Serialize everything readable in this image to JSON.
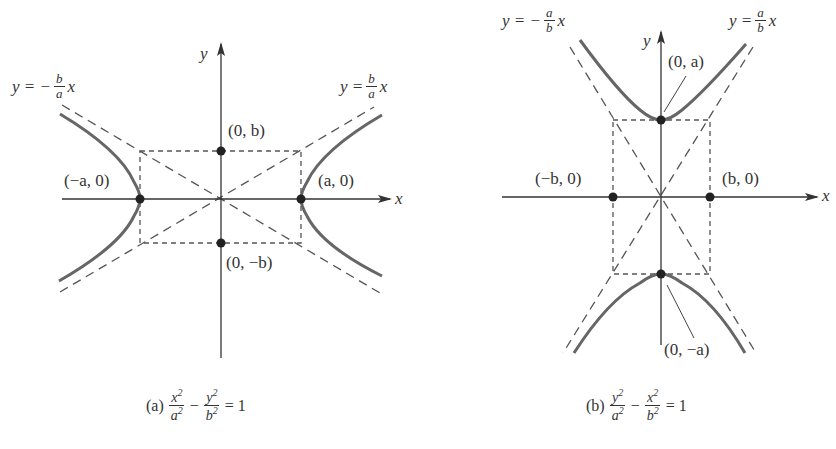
{
  "figure_a": {
    "axis_x_label": "x",
    "axis_y_label": "y",
    "asymptote_neg": {
      "prefix": "y = −",
      "num": "b",
      "den": "a",
      "suffix": "x"
    },
    "asymptote_pos": {
      "prefix": "y = ",
      "num": "b",
      "den": "a",
      "suffix": "x"
    },
    "points": {
      "top": "(0, b)",
      "bottom": "(0, −b)",
      "left": "(−a, 0)",
      "right": "(a, 0)"
    },
    "caption": {
      "tag": "(a)",
      "term1_num": "x",
      "term1_den": "a",
      "op": "−",
      "term2_num": "y",
      "term2_den": "b",
      "exp": "2",
      "rhs": "= 1"
    }
  },
  "figure_b": {
    "axis_x_label": "x",
    "axis_y_label": "y",
    "asymptote_neg": {
      "prefix": "y = −",
      "num": "a",
      "den": "b",
      "suffix": "x"
    },
    "asymptote_pos": {
      "prefix": "y = ",
      "num": "a",
      "den": "b",
      "suffix": "x"
    },
    "points": {
      "top": "(0, a)",
      "bottom": "(0, −a)",
      "left": "(−b, 0)",
      "right": "(b, 0)"
    },
    "caption": {
      "tag": "(b)",
      "term1_num": "y",
      "term1_den": "a",
      "op": "−",
      "term2_num": "x",
      "term2_den": "b",
      "exp": "2",
      "rhs": "= 1"
    }
  },
  "colors": {
    "curve": "#666666",
    "axis": "#333333",
    "dashed": "#555555",
    "point": "#222222"
  }
}
